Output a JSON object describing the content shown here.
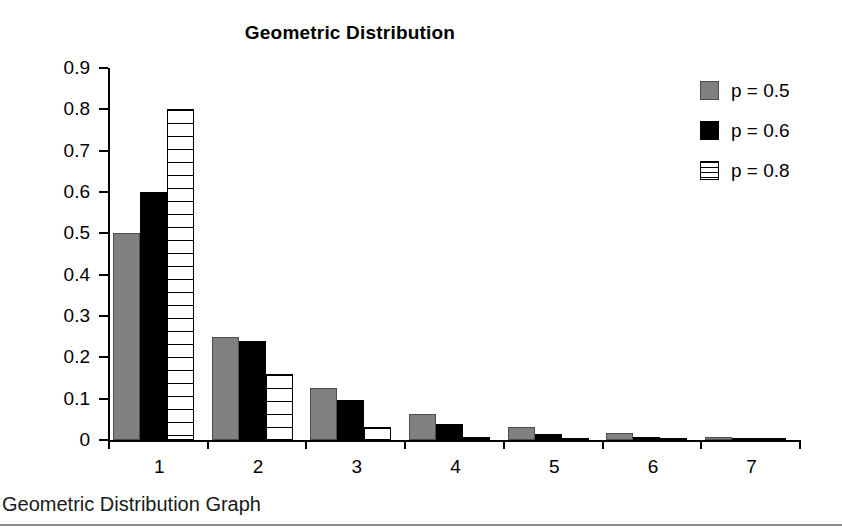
{
  "chart_data": {
    "type": "bar",
    "title": "Geometric Distribution",
    "xlabel": "",
    "ylabel": "",
    "categories": [
      "1",
      "2",
      "3",
      "4",
      "5",
      "6",
      "7"
    ],
    "ylim": [
      0,
      0.9
    ],
    "yticks": [
      "0",
      "0.1",
      "0.2",
      "0.3",
      "0.4",
      "0.5",
      "0.6",
      "0.7",
      "0.8",
      "0.9"
    ],
    "ytick_values": [
      0,
      0.1,
      0.2,
      0.3,
      0.4,
      0.5,
      0.6,
      0.7,
      0.8,
      0.9
    ],
    "grid": false,
    "legend_position": "right",
    "series": [
      {
        "name": "p = 0.5",
        "color": "#808080",
        "pattern": "solid-gray",
        "values": [
          0.5,
          0.25,
          0.125,
          0.0625,
          0.031,
          0.016,
          0.008
        ]
      },
      {
        "name": "p = 0.6",
        "color": "#000000",
        "pattern": "solid-black",
        "values": [
          0.6,
          0.24,
          0.096,
          0.0384,
          0.0154,
          0.0061,
          0.0025
        ]
      },
      {
        "name": "p = 0.8",
        "color": "#ffffff",
        "pattern": "horizontal-stripes",
        "values": [
          0.8,
          0.16,
          0.032,
          0.0064,
          0.0013,
          0.0003,
          0.0001
        ]
      }
    ]
  },
  "caption": {
    "text": "Geometric Distribution Graph"
  }
}
